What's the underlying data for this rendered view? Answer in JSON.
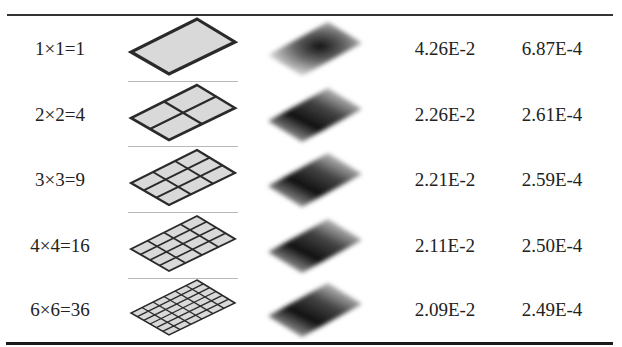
{
  "table": {
    "columns": [
      "Mesh division",
      "Mesh",
      "Field distribution",
      "Value 1",
      "Value 2"
    ],
    "rows": [
      {
        "label": "1×1=1",
        "n": 1,
        "v1": "4.26E-2",
        "v2": "6.87E-4",
        "field": "center-peak"
      },
      {
        "label": "2×2=4",
        "n": 2,
        "v1": "2.26E-2",
        "v2": "2.61E-4",
        "field": "edge-gradient"
      },
      {
        "label": "3×3=9",
        "n": 3,
        "v1": "2.21E-2",
        "v2": "2.59E-4",
        "field": "edge-gradient"
      },
      {
        "label": "4×4=16",
        "n": 4,
        "v1": "2.11E-2",
        "v2": "2.50E-4",
        "field": "edge-gradient"
      },
      {
        "label": "6×6=36",
        "n": 6,
        "v1": "2.09E-2",
        "v2": "2.49E-4",
        "field": "edge-gradient"
      }
    ]
  },
  "colors": {
    "rule": "#333333",
    "mesh_fill": "#d9d9d9",
    "mesh_stroke": "#2a2a2a",
    "divider": "#b8b8b8",
    "field_dark": "#111111"
  }
}
